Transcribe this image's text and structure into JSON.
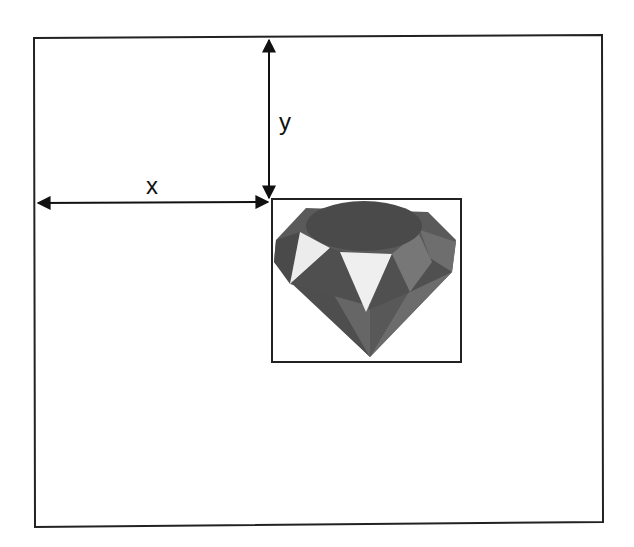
{
  "diagram": {
    "title": "",
    "labels": {
      "x": "x",
      "y": "y"
    },
    "elements": {
      "outer_frame": {
        "desc": "container boundary"
      },
      "inner_box": {
        "desc": "positioned element bounding box"
      },
      "icon": "ruby-gem-icon"
    },
    "colors": {
      "line": "#111111",
      "gem_dark": "#4a4a4a",
      "gem_mid": "#6a6a6a",
      "gem_light": "#ececec"
    }
  }
}
